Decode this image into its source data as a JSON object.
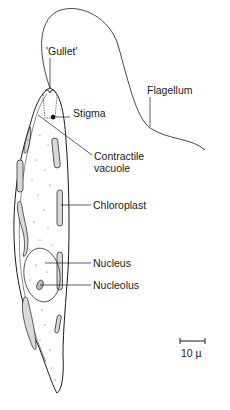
{
  "diagram": {
    "labels": {
      "gullet": "'Gullet'",
      "flagellum": "Flagellum",
      "stigma": "Stigma",
      "contractile_vacuole_line1": "Contractile",
      "contractile_vacuole_line2": "vacuole",
      "chloroplast": "Chloroplast",
      "nucleus": "Nucleus",
      "nucleolus": "Nucleolus"
    },
    "scale_bar": {
      "label": "10 µ"
    },
    "colors": {
      "line": "#1a1a1a",
      "background": "#ffffff",
      "stipple": "#555555"
    }
  }
}
